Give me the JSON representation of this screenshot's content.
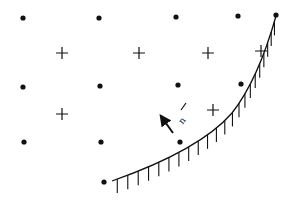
{
  "diagram": {
    "colors": {
      "ink": "#111111",
      "background": "#ffffff"
    },
    "dots": [
      [
        23,
        18
      ],
      [
        99,
        18
      ],
      [
        176,
        17
      ],
      [
        238,
        16
      ],
      [
        276,
        15
      ],
      [
        23,
        87
      ],
      [
        100,
        86
      ],
      [
        178,
        85
      ],
      [
        241,
        84
      ],
      [
        24,
        142
      ],
      [
        101,
        142
      ],
      [
        180,
        142
      ],
      [
        104,
        182
      ]
    ],
    "crosses": [
      [
        62,
        53
      ],
      [
        139,
        53
      ],
      [
        208,
        53
      ],
      [
        261,
        51
      ],
      [
        62,
        114
      ],
      [
        213,
        110
      ]
    ],
    "boundary": {
      "path": "M 112 181 Q 200 150 232 113 Q 258 80 276 16",
      "hatch_count": 22
    },
    "normal_vector": {
      "label": "n",
      "from": [
        173,
        133
      ],
      "to": [
        163,
        119
      ]
    }
  }
}
